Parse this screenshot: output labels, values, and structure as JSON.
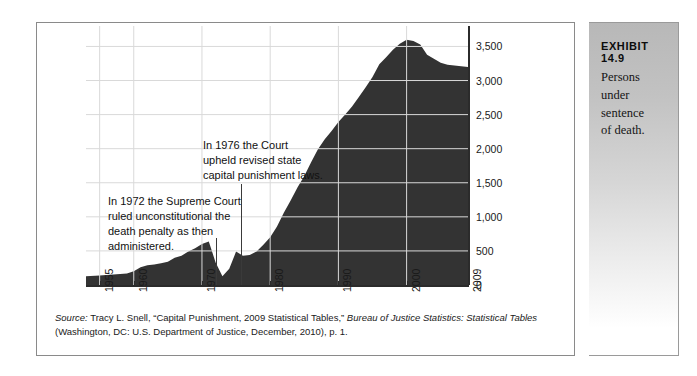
{
  "exhibit": {
    "number_label": "EXHIBIT 14.9",
    "caption": "Persons under\nsentence\nof death."
  },
  "annotations": [
    {
      "name": "annotation-1976",
      "text": "In 1976 the Court\nupheld revised state\ncapital punishment laws.",
      "year": 1976
    },
    {
      "name": "annotation-1972",
      "text": "In 1972 the Supreme Court\nruled unconstitutional the\ndeath penalty as then\nadministered.",
      "year": 1972
    }
  ],
  "source": {
    "label": "Source:",
    "line1_a": " Tracy L. Snell, “Capital Punishment, 2009 Statistical Tables,” ",
    "line1_b": "Bureau of Justice Statistics: Statistical Tables",
    "line2": " (Washington, DC: U.S. Department of Justice, December, 2010), p. 1."
  },
  "chart_data": {
    "type": "area",
    "title": "Persons under sentence of death",
    "xlabel": "",
    "ylabel": "",
    "xlim": [
      1953,
      2009
    ],
    "ylim": [
      0,
      3800
    ],
    "grid": true,
    "legend": "none",
    "fill_color": "#333333",
    "gridline_color": "#d9d9d9",
    "y_ticks": [
      0,
      500,
      1000,
      1500,
      2000,
      2500,
      3000,
      3500
    ],
    "y_tick_labels": [
      "0",
      "500",
      "1,000",
      "1,500",
      "2,000",
      "2,500",
      "3,000",
      "3,500"
    ],
    "x_ticks": [
      1955,
      1960,
      1970,
      1980,
      1990,
      2000,
      2009
    ],
    "x_tick_labels": [
      "1955",
      "1960",
      "1970",
      "1980",
      "1990",
      "2000",
      "2009"
    ],
    "x": [
      1953,
      1955,
      1957,
      1959,
      1960,
      1961,
      1962,
      1963,
      1964,
      1965,
      1966,
      1967,
      1968,
      1969,
      1970,
      1971,
      1972,
      1973,
      1974,
      1975,
      1976,
      1977,
      1978,
      1979,
      1980,
      1981,
      1982,
      1983,
      1984,
      1985,
      1986,
      1987,
      1988,
      1989,
      1990,
      1991,
      1992,
      1993,
      1994,
      1995,
      1996,
      1997,
      1998,
      1999,
      2000,
      2001,
      2002,
      2003,
      2004,
      2005,
      2006,
      2007,
      2008,
      2009
    ],
    "y": [
      130,
      140,
      155,
      170,
      200,
      260,
      290,
      300,
      320,
      340,
      400,
      430,
      490,
      540,
      600,
      640,
      330,
      130,
      240,
      490,
      430,
      440,
      490,
      590,
      700,
      860,
      1060,
      1240,
      1430,
      1600,
      1800,
      1990,
      2140,
      2260,
      2390,
      2500,
      2620,
      2760,
      2900,
      3050,
      3240,
      3340,
      3450,
      3540,
      3600,
      3580,
      3530,
      3380,
      3320,
      3260,
      3230,
      3220,
      3210,
      3200
    ]
  }
}
